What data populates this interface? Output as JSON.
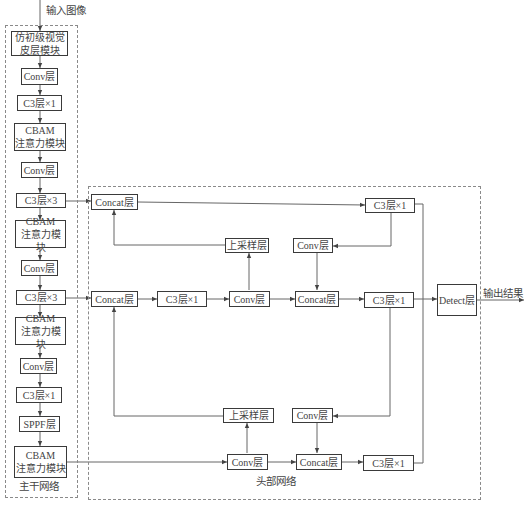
{
  "diagram": {
    "input_label": "输入图像",
    "output_label": "输出结果",
    "backbone": {
      "title": "主干网络",
      "blocks": [
        "仿初级视觉\n皮层模块",
        "Conv层",
        "C3层×1",
        "CBAM\n注意力模块",
        "Conv层",
        "C3层×3",
        "CBAM\n注意力模块",
        "Conv层",
        "C3层×3",
        "CBAM\n注意力模块",
        "Conv层",
        "C3层×1",
        "SPPF层",
        "CBAM\n注意力模块"
      ]
    },
    "head": {
      "title": "头部网络",
      "top_row": {
        "concat": "Concat层",
        "c3": "C3层×1"
      },
      "upper_mid_row": {
        "upsample": "上采样层",
        "conv": "Conv层"
      },
      "mid_row": {
        "concat": "Concat层",
        "c3_a": "C3层×1",
        "conv": "Conv层",
        "concat_b": "Concat层",
        "c3_b": "C3层×1"
      },
      "lower_mid_row": {
        "upsample": "上采样层",
        "conv": "Conv层"
      },
      "bottom_row": {
        "conv": "Conv层",
        "concat": "Concat层",
        "c3": "C3层×1"
      },
      "detect": "Detect层"
    },
    "colors": {
      "line": "#555555",
      "border": "#3a3a3a",
      "dashed": "#8a8a8a"
    }
  }
}
